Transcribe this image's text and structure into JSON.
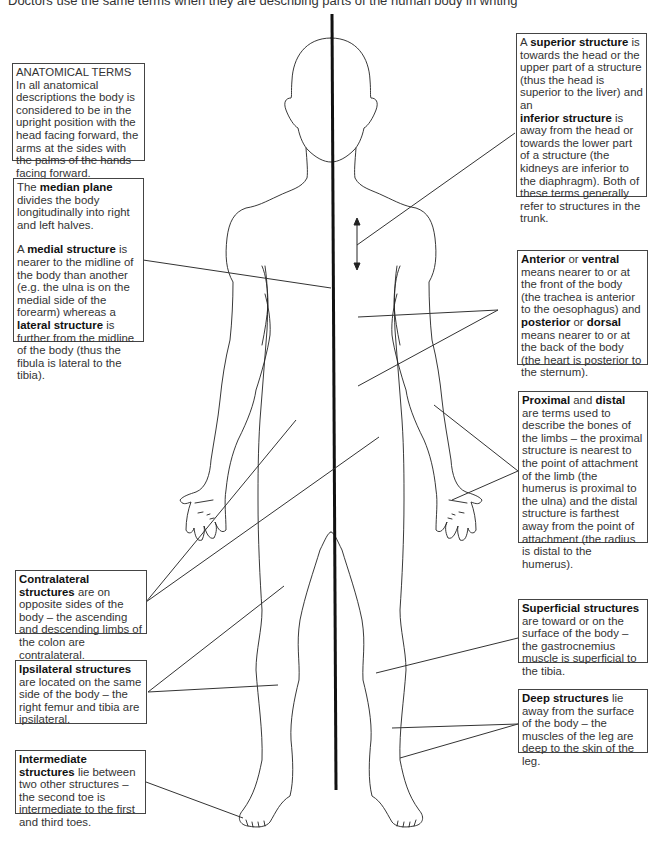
{
  "intro": "Doctors use the same terms when they are describing parts of the human body in writing",
  "colors": {
    "line": "#222222",
    "midline": "#111111",
    "box_border": "#444444",
    "text": "#333333"
  },
  "boxes": {
    "anatomical_terms": {
      "title": "ANATOMICAL TERMS",
      "text": "In all anatomical descriptions the body is considered to be in the upright position with the head facing forward, the arms at the sides with the palms of the hands facing forward."
    },
    "median": {
      "p1_pre": "The ",
      "p1_bold": "median plane",
      "p1_post": " divides the body longitudinally into right and left halves.",
      "p2_pre": "A ",
      "p2_bold": "medial structure",
      "p2_mid": " is nearer to the midline of the body than another (e.g. the ulna is on the medial side of the forearm) whereas a ",
      "p2_bold2": "lateral structure",
      "p2_post": " is further from the midline of the body (thus the fibula is lateral to the tibia)."
    },
    "superior": {
      "pre": "A ",
      "bold": "superior structure",
      "mid": " is towards the head or the upper part of a structure (thus the head is superior to the liver) and an",
      "bold2": "inferior structure",
      "post": " is away from the head or towards the lower part of a structure (the kidneys are inferior to the diaphragm). Both of these terms generally refer to structures in the trunk."
    },
    "anterior": {
      "bold": "Anterior",
      "t1": " or ",
      "bold2": "ventral",
      "t2": " means nearer to or at the front of the body (the trachea is anterior to the oesophagus) and ",
      "bold3": "posterior",
      "t3": " or ",
      "bold4": "dorsal",
      "t4": " means nearer to or at the back of the body (the heart is posterior to the sternum)."
    },
    "proximal": {
      "bold": "Proximal",
      "t1": " and ",
      "bold2": "distal",
      "t2": " are terms used to describe the bones of the limbs – the proximal structure is nearest to the point of attachment of the limb (the humerus is proximal to the ulna) and the distal structure is farthest away from the point of attachment (the radius is distal to the humerus)."
    },
    "contralateral": {
      "bold": "Contralateral structures",
      "text": " are on opposite sides of the body – the ascending and descending limbs of the colon are contralateral."
    },
    "ipsilateral": {
      "bold": "Ipsilateral structures",
      "text": " are located on the same side of the body – the right femur and tibia are ipsilateral."
    },
    "intermediate": {
      "bold": "Intermediate structures",
      "text": " lie between two other structures – the second toe is intermediate to the first and third toes."
    },
    "superficial": {
      "bold": "Superficial structures",
      "text": " are toward or on the surface of the body – the gastrocnemius muscle is superficial to the tibia."
    },
    "deep": {
      "bold": "Deep structures",
      "text": " lie away from the surface of the body – the muscles of the leg are deep to the skin of the leg."
    }
  }
}
